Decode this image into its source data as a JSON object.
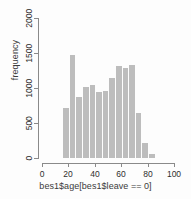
{
  "chart_data": {
    "type": "bar",
    "title": "",
    "subtitle": "",
    "xlabel": "bes1$age[bes1$leave == 0]",
    "ylabel": "frequency",
    "xlim": [
      0,
      100
    ],
    "ylim": [
      0,
      2000
    ],
    "grid": false,
    "legend": null,
    "bin_width": 5,
    "bar_color": "#bdbdbd",
    "axis_color": "#8a8a8a",
    "xticks": [
      0,
      20,
      40,
      60,
      80,
      100
    ],
    "xtick_labels": [
      "0",
      "20",
      "40",
      "60",
      "80",
      "100"
    ],
    "yticks": [
      0,
      500,
      1000,
      1500,
      2000
    ],
    "ytick_labels": [
      "0",
      "500",
      "1000",
      "1500",
      "2000"
    ],
    "bins": [
      {
        "x0": 16,
        "x1": 21,
        "value": 720
      },
      {
        "x0": 21,
        "x1": 26,
        "value": 1470
      },
      {
        "x0": 26,
        "x1": 31,
        "value": 870
      },
      {
        "x0": 31,
        "x1": 36,
        "value": 1020
      },
      {
        "x0": 36,
        "x1": 41,
        "value": 1050
      },
      {
        "x0": 41,
        "x1": 46,
        "value": 950
      },
      {
        "x0": 46,
        "x1": 51,
        "value": 960
      },
      {
        "x0": 51,
        "x1": 56,
        "value": 1150
      },
      {
        "x0": 56,
        "x1": 61,
        "value": 1320
      },
      {
        "x0": 61,
        "x1": 66,
        "value": 1290
      },
      {
        "x0": 66,
        "x1": 71,
        "value": 1330
      },
      {
        "x0": 71,
        "x1": 76,
        "value": 650
      },
      {
        "x0": 76,
        "x1": 81,
        "value": 220
      },
      {
        "x0": 81,
        "x1": 86,
        "value": 60
      }
    ],
    "categories": [
      "16-21",
      "21-26",
      "26-31",
      "31-36",
      "36-41",
      "41-46",
      "46-51",
      "51-56",
      "56-61",
      "61-66",
      "66-71",
      "71-76",
      "76-81",
      "81-86"
    ],
    "values": [
      720,
      1470,
      870,
      1020,
      1050,
      950,
      960,
      1150,
      1320,
      1290,
      1330,
      650,
      220,
      60
    ]
  }
}
